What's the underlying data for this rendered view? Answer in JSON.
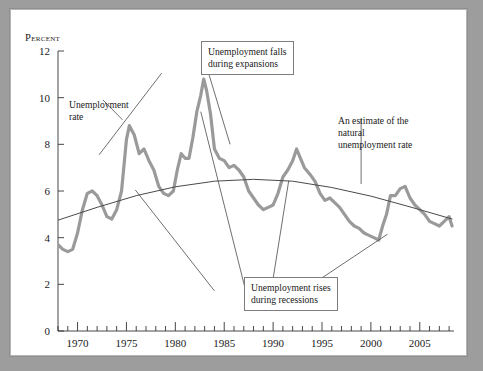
{
  "figure": {
    "axis_title": "Percent",
    "background": "#ffffff",
    "frame_color": "#9d9d9d"
  },
  "annotations": {
    "unemployment_rate": "Unemployment\nrate",
    "natural_rate": "An estimate of the\nnatural\nunemployment rate",
    "falls_expansions": "Unemployment falls\nduring expansions",
    "rises_recessions": "Unemployment rises\nduring recessions"
  },
  "chart_data": {
    "type": "line",
    "title": "",
    "xlabel": "",
    "ylabel": "Percent",
    "xlim": [
      1968,
      2008.5
    ],
    "ylim": [
      0,
      12
    ],
    "yticks": [
      0,
      2,
      4,
      6,
      8,
      10,
      12
    ],
    "xticks": [
      1970,
      1975,
      1980,
      1985,
      1990,
      1995,
      2000,
      2005
    ],
    "xminor_step": 1,
    "grid": false,
    "legend": "none",
    "series": [
      {
        "name": "Unemployment rate",
        "color": "#9a9a9a",
        "width": 3.2,
        "x": [
          1968.0,
          1968.5,
          1969.0,
          1969.5,
          1970.0,
          1970.5,
          1971.0,
          1971.5,
          1972.0,
          1972.5,
          1973.0,
          1973.5,
          1974.0,
          1974.5,
          1975.0,
          1975.3,
          1975.8,
          1976.3,
          1976.8,
          1977.3,
          1977.8,
          1978.3,
          1978.8,
          1979.3,
          1979.8,
          1980.2,
          1980.6,
          1981.0,
          1981.4,
          1981.8,
          1982.2,
          1982.6,
          1982.9,
          1983.2,
          1983.6,
          1984.0,
          1984.5,
          1985.0,
          1985.5,
          1986.0,
          1986.5,
          1987.0,
          1987.5,
          1988.0,
          1988.5,
          1989.0,
          1989.5,
          1990.0,
          1990.5,
          1991.0,
          1991.5,
          1992.0,
          1992.4,
          1992.8,
          1993.2,
          1993.8,
          1994.3,
          1994.8,
          1995.3,
          1995.8,
          1996.3,
          1996.8,
          1997.3,
          1997.8,
          1998.3,
          1998.8,
          1999.3,
          1999.8,
          2000.3,
          2000.8,
          2001.2,
          2001.6,
          2002.0,
          2002.5,
          2003.0,
          2003.5,
          2004.0,
          2004.5,
          2005.0,
          2005.5,
          2006.0,
          2006.5,
          2007.0,
          2007.5,
          2008.0,
          2008.3
        ],
        "y": [
          3.7,
          3.5,
          3.4,
          3.5,
          4.2,
          5.2,
          5.9,
          6.0,
          5.8,
          5.4,
          4.9,
          4.8,
          5.2,
          6.0,
          8.2,
          8.8,
          8.4,
          7.6,
          7.8,
          7.3,
          6.9,
          6.2,
          5.9,
          5.8,
          6.0,
          6.9,
          7.6,
          7.4,
          7.4,
          8.3,
          9.4,
          10.1,
          10.8,
          10.3,
          9.3,
          7.8,
          7.4,
          7.3,
          7.0,
          7.1,
          6.9,
          6.6,
          6.0,
          5.7,
          5.4,
          5.2,
          5.3,
          5.4,
          5.9,
          6.6,
          6.9,
          7.3,
          7.8,
          7.4,
          7.0,
          6.7,
          6.4,
          5.9,
          5.6,
          5.7,
          5.5,
          5.3,
          5.0,
          4.7,
          4.5,
          4.4,
          4.2,
          4.1,
          4.0,
          3.9,
          4.5,
          5.0,
          5.8,
          5.8,
          6.1,
          6.2,
          5.7,
          5.4,
          5.2,
          5.0,
          4.7,
          4.6,
          4.5,
          4.7,
          4.9,
          4.5
        ]
      },
      {
        "name": "An estimate of the natural unemployment rate",
        "color": "#4a4a4a",
        "width": 1.0,
        "x": [
          1968,
          1972,
          1976,
          1980,
          1984,
          1988,
          1992,
          1996,
          2000,
          2004,
          2008.3
        ],
        "y": [
          4.75,
          5.3,
          5.8,
          6.18,
          6.42,
          6.5,
          6.42,
          6.15,
          5.78,
          5.32,
          4.8
        ]
      }
    ],
    "leaders": [
      {
        "name": "unemployment-rate-leader",
        "from": [
          1972.6,
          9.9
        ],
        "to": [
          1974.6,
          9.05
        ]
      },
      {
        "name": "natural-rate-leader",
        "from": [
          1999.0,
          9.1
        ],
        "to": [
          1999.0,
          6.3
        ]
      },
      {
        "name": "falls-leader-left",
        "from": [
          1978.6,
          11.05
        ],
        "to": [
          1972.2,
          7.55
        ]
      },
      {
        "name": "falls-leader-right",
        "from": [
          1983.4,
          11.05
        ],
        "to": [
          1985.6,
          8.0
        ]
      },
      {
        "name": "rises-leader-left",
        "from": [
          1984.0,
          1.72
        ],
        "to": [
          1975.9,
          6.05
        ]
      },
      {
        "name": "rises-leader-mid",
        "from": [
          1987.2,
          1.72
        ],
        "to": [
          1982.6,
          9.4
        ]
      },
      {
        "name": "rises-leader-mid2",
        "from": [
          1989.8,
          1.72
        ],
        "to": [
          1991.6,
          6.45
        ]
      },
      {
        "name": "rises-leader-right",
        "from": [
          1993.0,
          1.72
        ],
        "to": [
          2001.7,
          4.15
        ]
      }
    ]
  },
  "ticks": {
    "y": [
      "0",
      "2",
      "4",
      "6",
      "8",
      "10",
      "12"
    ],
    "x": [
      "1970",
      "1975",
      "1980",
      "1985",
      "1990",
      "1995",
      "2000",
      "2005"
    ]
  }
}
